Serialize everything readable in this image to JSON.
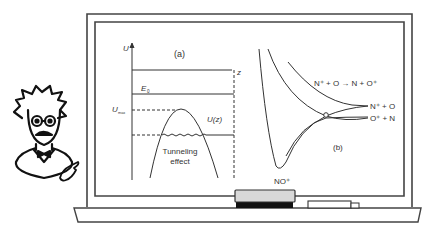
{
  "figure": {
    "panel_a": {
      "label": "(a)",
      "y_axis_label": "U",
      "x_axis_label": "z",
      "energy_level_label": "E",
      "energy_level_subscript": "0",
      "barrier_max_label": "U",
      "barrier_max_subscript": "max",
      "curve_label": "U(z)",
      "annotation_line1": "Tunneling",
      "annotation_line2": "effect"
    },
    "panel_b": {
      "label": "(b)",
      "reaction": "N⁺ + O → N + O⁺",
      "asymptote_upper": "N⁺ + O",
      "asymptote_lower": "O⁺ + N",
      "well_label": "NO⁺"
    },
    "colors": {
      "ink": "#333333",
      "board_frame": "#444444",
      "eraser_top": "#d8d8d8",
      "eraser_bottom": "#111111",
      "background": "#ffffff"
    }
  }
}
